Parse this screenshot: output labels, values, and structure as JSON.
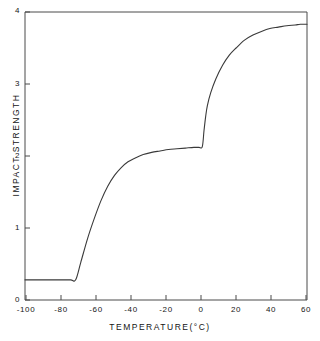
{
  "chart_data": {
    "type": "line",
    "title": "",
    "xlabel": "TEMPERATURE(°C)",
    "ylabel": "IMPACT  STRENGTH",
    "xlim": [
      -105,
      62
    ],
    "ylim": [
      0,
      4
    ],
    "xticks": [
      -100,
      -80,
      -60,
      -40,
      -20,
      0,
      20,
      40,
      60
    ],
    "xtick_labels": [
      "-100",
      "-80",
      "-60",
      "-40",
      "-20",
      "0",
      "20",
      "40",
      "60"
    ],
    "yticks": [
      0,
      1,
      2,
      3,
      4
    ],
    "ytick_labels": [
      "0",
      "1",
      "2",
      "3",
      "4"
    ],
    "grid": false,
    "legend": "none",
    "series": [
      {
        "name": "impact strength",
        "color": "#3a3a3a",
        "x": [
          -105,
          -95,
          -85,
          -78,
          -75,
          -72,
          -68,
          -64,
          -60,
          -56,
          -52,
          -48,
          -44,
          -40,
          -35,
          -30,
          -25,
          -20,
          -15,
          -10,
          -5,
          -2,
          0,
          1,
          2,
          3,
          5,
          8,
          12,
          16,
          20,
          25,
          30,
          35,
          40,
          45,
          50,
          55,
          58,
          62
        ],
        "y": [
          0.28,
          0.28,
          0.28,
          0.28,
          0.28,
          0.52,
          0.85,
          1.13,
          1.38,
          1.58,
          1.73,
          1.84,
          1.92,
          1.97,
          2.02,
          2.05,
          2.07,
          2.09,
          2.1,
          2.11,
          2.12,
          2.12,
          2.13,
          2.35,
          2.55,
          2.7,
          2.88,
          3.07,
          3.26,
          3.4,
          3.5,
          3.61,
          3.68,
          3.73,
          3.77,
          3.79,
          3.81,
          3.82,
          3.83,
          3.83
        ]
      }
    ],
    "annotations": {
      "plateau_value": 2.13,
      "brittle_plateau_value": 0.28,
      "ductile_transition_temp": -75,
      "step_transition_temp": 0,
      "max_value": 3.83
    }
  },
  "axes": {
    "frame_color": "#4a4a4a",
    "curve_color": "#3a3a3a"
  }
}
